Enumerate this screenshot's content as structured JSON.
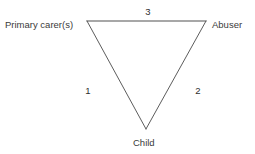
{
  "diagram": {
    "type": "triangle-relationship-diagram",
    "background_color": "#ffffff",
    "nodes": [
      {
        "id": "primary-carers",
        "label": "Primary carer(s)",
        "position": "top-left"
      },
      {
        "id": "abuser",
        "label": "Abuser",
        "position": "top-right"
      },
      {
        "id": "child",
        "label": "Child",
        "position": "bottom"
      }
    ],
    "edges": [
      {
        "id": "edge-1",
        "label": "1",
        "from": "primary-carers",
        "to": "child",
        "side": "left"
      },
      {
        "id": "edge-2",
        "label": "2",
        "from": "abuser",
        "to": "child",
        "side": "right"
      },
      {
        "id": "edge-3",
        "label": "3",
        "from": "primary-carers",
        "to": "abuser",
        "side": "top"
      }
    ],
    "geometry": {
      "vertex_top_left": {
        "x": 87,
        "y": 21
      },
      "vertex_top_right": {
        "x": 206,
        "y": 21
      },
      "vertex_bottom": {
        "x": 146,
        "y": 129
      }
    },
    "style": {
      "top_edge_color": "#8a8a8a",
      "diagonal_edge_color": "#4a4a4a",
      "text_color": "#3a3a3a",
      "stroke_width": 1
    }
  }
}
